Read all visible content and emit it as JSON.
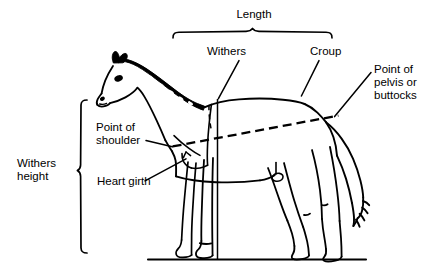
{
  "figure": {
    "type": "diagram",
    "stroke_color": "#000000",
    "background_color": "#ffffff"
  },
  "labels": {
    "length": "Length",
    "withers": "Withers",
    "croup": "Croup",
    "point_of_pelvis": "Point of\npelvis or\nbuttocks",
    "point_of_pelvis_line1": "Point of",
    "point_of_pelvis_line2": "pelvis or",
    "point_of_pelvis_line3": "buttocks",
    "point_of_shoulder": "Point of\nshoulder",
    "point_of_shoulder_line1": "Point of",
    "point_of_shoulder_line2": "shoulder",
    "heart_girth": "Heart girth",
    "withers_height": "Withers\nheight",
    "withers_height_line1": "Withers",
    "withers_height_line2": "height"
  },
  "measurements": [
    {
      "name": "Length",
      "marker": "horizontal-brace-top",
      "from": "point of shoulder",
      "to": "point of pelvis or buttocks",
      "line_style": "dashed"
    },
    {
      "name": "Withers height",
      "marker": "vertical-brace-left",
      "from": "ground",
      "to": "withers",
      "line_style": "solid"
    },
    {
      "name": "Heart girth",
      "marker": "leader-line",
      "from": "behind withers",
      "to": "around barrel",
      "line_style": "solid"
    }
  ],
  "landmarks": [
    "Withers",
    "Croup",
    "Point of pelvis or buttocks",
    "Point of shoulder",
    "Heart girth"
  ]
}
